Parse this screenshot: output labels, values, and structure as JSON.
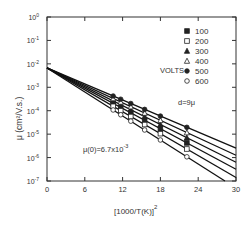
{
  "chart_data": {
    "type": "line",
    "title": "",
    "xlabel": "[1000/T(K)]^2",
    "ylabel": "μ (cm²/V.s.)",
    "yscale": "log",
    "xlim": [
      0,
      30
    ],
    "ylim": [
      1e-07,
      1
    ],
    "x_ticks": [
      0,
      6,
      12,
      18,
      24,
      30
    ],
    "y_ticks": [
      "10^0",
      "10^-1",
      "10^-2",
      "10^-3",
      "10^-4",
      "10^-5",
      "10^-6",
      "10^-7"
    ],
    "legend_title": "VOLTS",
    "legend_position": "upper right",
    "annotations": [
      "d=9μ",
      "μ(0)=6.7x10^-3"
    ],
    "intercept_mu0": 0.0067,
    "marker_x": [
      10.5,
      11.7,
      13.3,
      15.5,
      18,
      22.2
    ],
    "series": [
      {
        "name": "100",
        "marker": "filled-square",
        "log10_at_x30": -6.5
      },
      {
        "name": "200",
        "marker": "open-square",
        "log10_at_x30": -6.85
      },
      {
        "name": "300",
        "marker": "filled-triangle",
        "log10_at_x30": -6.2
      },
      {
        "name": "400",
        "marker": "open-triangle",
        "log10_at_x30": -5.9
      },
      {
        "name": "500",
        "marker": "filled-circle",
        "log10_at_x30": -5.6
      },
      {
        "name": "600",
        "marker": "open-circle",
        "log10_at_x30": -7.3
      }
    ]
  },
  "labels": {
    "legend_title": "VOLTS",
    "thickness": "d=9μ",
    "mu0": "μ(0)=6.7x10",
    "mu0_exp": "-3",
    "xlabel": "[1000/T(K)]",
    "xlabel_exp": "2",
    "ylabel": "μ (cm²/V.s.)"
  }
}
